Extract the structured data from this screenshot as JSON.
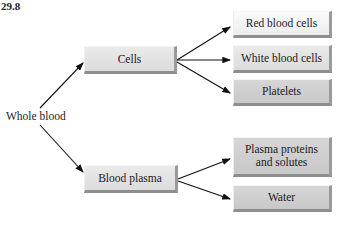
{
  "figure": {
    "number": "29.8",
    "root": "Whole blood",
    "branches": [
      {
        "label": "Cells",
        "children": [
          "Red blood cells",
          "White blood cells",
          "Platelets"
        ]
      },
      {
        "label": "Blood plasma",
        "children": [
          "Plasma proteins and solutes",
          "Water"
        ]
      }
    ]
  },
  "display": {
    "plasma_proteins_line1": "Plasma proteins",
    "plasma_proteins_line2": "and solutes"
  }
}
